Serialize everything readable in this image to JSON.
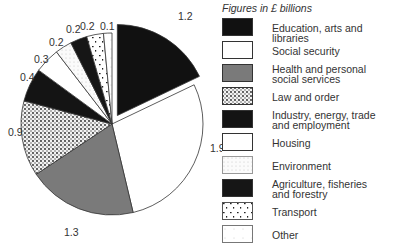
{
  "chart_data": {
    "type": "pie",
    "title": "Figures in £ billions",
    "unit": "£ billions",
    "categories": [
      "Education, arts and libraries",
      "Social security",
      "Health and personal social services",
      "Law and order",
      "Industry, energy, trade and employment",
      "Housing",
      "Environment",
      "Agriculture, fisheries and forestry",
      "Transport",
      "Other"
    ],
    "values": [
      1.2,
      1.9,
      1.3,
      0.9,
      0.4,
      0.3,
      0.2,
      0.2,
      0.2,
      0.1
    ],
    "value_labels": [
      "1.2",
      "1.9",
      "1.3",
      "0.9",
      "0.4",
      "0.3",
      "0.2",
      "0.2",
      "0.2",
      "0.1"
    ],
    "exploded": [
      "Education, arts and libraries"
    ],
    "legend_position": "right",
    "fills": [
      "#111111",
      "#ffffff",
      "#7a7a7a",
      "dense-dots",
      "#141414",
      "#ffffff",
      "light-dots",
      "#161616",
      "sparse-dashes",
      "#ffffff"
    ]
  },
  "legend": {
    "title": "Figures in £ billions",
    "items": [
      {
        "label": "Education, arts and libraries"
      },
      {
        "label": "Social security"
      },
      {
        "label": "Health and personal\nsocial services"
      },
      {
        "label": "Law and order"
      },
      {
        "label": "Industry, energy, trade\nand employment"
      },
      {
        "label": "Housing"
      },
      {
        "label": "Environment"
      },
      {
        "label": "Agriculture, fisheries\nand forestry"
      },
      {
        "label": "Transport"
      },
      {
        "label": "Other"
      }
    ]
  }
}
